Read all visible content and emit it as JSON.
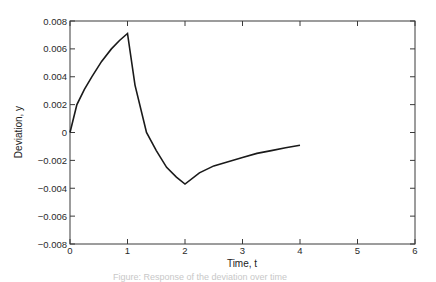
{
  "chart_data": {
    "type": "line",
    "title": "",
    "xlabel": "Time, t",
    "ylabel": "Deviation, y",
    "xlim": [
      0,
      6
    ],
    "ylim": [
      -0.008,
      0.008
    ],
    "x_ticks": [
      0,
      1,
      2,
      3,
      4,
      5,
      6
    ],
    "x_tick_labels": [
      "0",
      "1",
      "2",
      "3",
      "4",
      "5",
      "6"
    ],
    "y_ticks": [
      0.008,
      0.006,
      0.004,
      0.002,
      0,
      -0.002,
      -0.004,
      -0.006,
      -0.008
    ],
    "y_tick_labels": [
      "0.008",
      "0.006",
      "0.004",
      "0.002",
      "0",
      "−0.002",
      "−0.004",
      "−0.006",
      "−0.008"
    ],
    "grid": false,
    "legend": null,
    "series": [
      {
        "name": "y(t)",
        "color": "#1a1a1a",
        "x": [
          0,
          0.12,
          0.25,
          0.38,
          0.55,
          0.72,
          0.86,
          1.0,
          1.13,
          1.33,
          1.5,
          1.68,
          1.85,
          2.0,
          2.25,
          2.5,
          2.75,
          3.0,
          3.25,
          3.5,
          3.75,
          4.0
        ],
        "y": [
          0.0,
          0.002,
          0.0031,
          0.004,
          0.0051,
          0.006,
          0.0066,
          0.0071,
          0.0034,
          0.0,
          -0.0013,
          -0.0025,
          -0.0032,
          -0.0037,
          -0.0029,
          -0.0024,
          -0.0021,
          -0.0018,
          -0.0015,
          -0.0013,
          -0.0011,
          -0.00092
        ]
      }
    ]
  },
  "caption": "Figure: Response of the deviation over time"
}
